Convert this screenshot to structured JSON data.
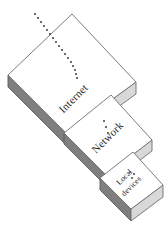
{
  "figure": {
    "background_color": "#ffffff",
    "width": 165,
    "height": 243
  },
  "colors": {
    "top_face": "#ffffff",
    "right_face": "#d8d8d8",
    "bottom_face": "#7f7f7f",
    "mid_face": "#b5b5b5",
    "outline": "#6e6e6e",
    "text": "#2b2b2b",
    "dot": "#4a4a4a"
  },
  "layers": [
    {
      "id": "internet",
      "label": "Internet",
      "order": 1,
      "size": "large",
      "label_rotation_deg": -45
    },
    {
      "id": "network",
      "label": "Network",
      "order": 2,
      "size": "medium",
      "label_rotation_deg": -45
    },
    {
      "id": "local-devices",
      "label_line1": "Local",
      "label_line2": "devices",
      "label": "Local devices",
      "order": 3,
      "size": "small",
      "label_rotation_deg": -45
    }
  ],
  "connectors": [
    {
      "id": "internet-trail",
      "style": "dotted",
      "description": "dotted arc entering the Internet layer from upper left",
      "dot_count": 17
    },
    {
      "id": "internet-to-network",
      "style": "dotted",
      "description": "dotted link between Internet and Network layers",
      "dot_count": 3
    },
    {
      "id": "network-to-local",
      "style": "dotted",
      "description": "dotted link between Network and Local devices layers",
      "dot_count": 3
    }
  ]
}
